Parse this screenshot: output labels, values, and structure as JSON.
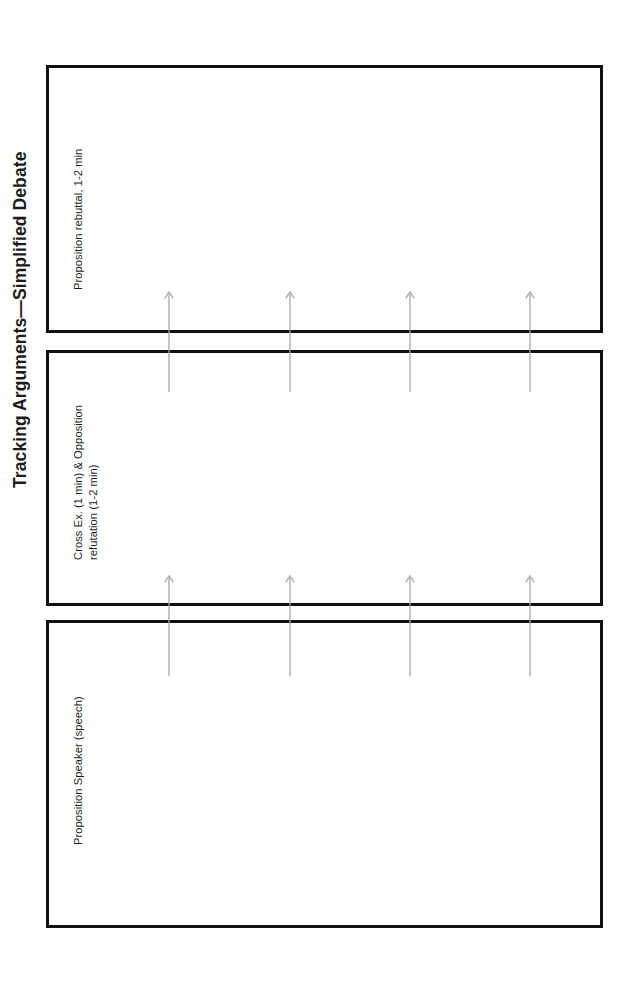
{
  "page": {
    "title": "Tracking Arguments—Simplified Debate",
    "width": 625,
    "height": 992,
    "background_color": "#ffffff",
    "orientation": "rotated-90-ccw"
  },
  "panels": [
    {
      "id": "panel-0",
      "label": "Proposition rebuttal, 1-2 min",
      "border_color": "#101010",
      "fill_color": "#ffffff",
      "order": 3
    },
    {
      "id": "panel-1",
      "label": "Cross Ex. (1 min) & Opposition\nrefutation (1-2 min)",
      "border_color": "#101010",
      "fill_color": "#ffffff",
      "order": 2
    },
    {
      "id": "panel-2",
      "label": "Proposition Speaker (speech)",
      "border_color": "#101010",
      "fill_color": "#ffffff",
      "order": 1
    }
  ],
  "arrow_groups": [
    {
      "id": "arrows-between-panel-2-and-panel-1",
      "count": 4,
      "direction": "up",
      "color": "#a6a6a6",
      "x_positions": [
        169,
        290,
        410,
        530
      ],
      "y_top": 572,
      "y_bottom": 676
    },
    {
      "id": "arrows-between-panel-1-and-panel-0",
      "count": 4,
      "direction": "up",
      "color": "#a6a6a6",
      "x_positions": [
        169,
        290,
        410,
        530
      ],
      "y_top": 288,
      "y_bottom": 392
    }
  ]
}
